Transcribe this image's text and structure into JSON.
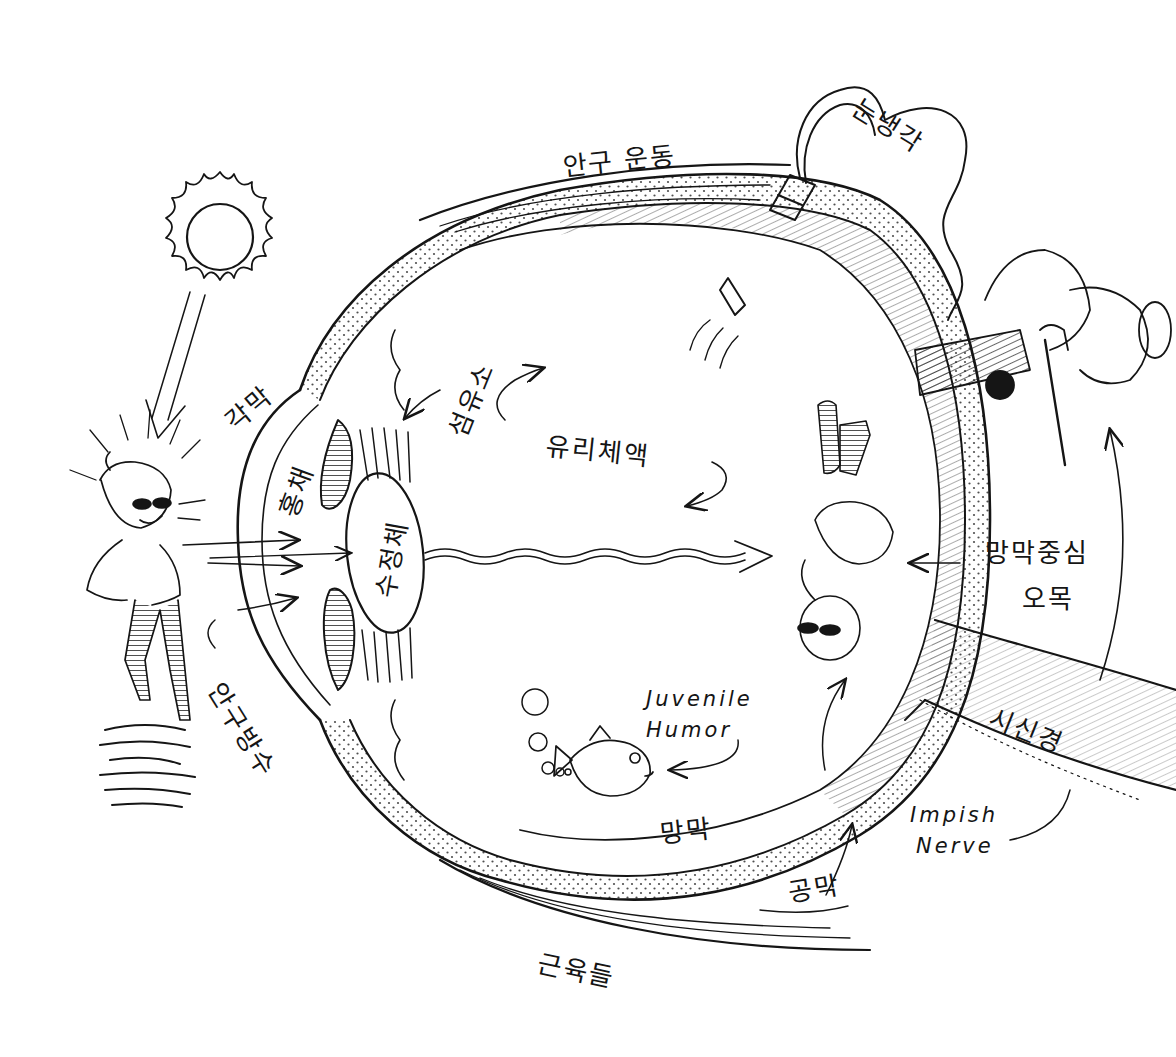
{
  "diagram": {
    "colors": {
      "ink": "#151515",
      "background": "#ffffff"
    },
    "labels": {
      "eye_movement": "안구 운동",
      "cooling_water": "눈냉각",
      "cornea": "각막",
      "iris": "홍채",
      "lens": "수정체",
      "ciliary": "섬유소",
      "vitreous": "유리체액",
      "fovea_line1": "망막중심",
      "fovea_line2": "오목",
      "aqueous": "안구방수",
      "juvenile_line1": "Juvenile",
      "juvenile_line2": "Humor",
      "optic_nerve": "시신경",
      "impish_line1": "Impish",
      "impish_line2": "Nerve",
      "retina": "망막",
      "sclera": "공막",
      "muscles": "근육들"
    },
    "figures": [
      "sun",
      "boy-with-sunglasses",
      "inverted-image-of-boy",
      "fish",
      "bubbles",
      "gnome-with-pump",
      "water-bulb-hose"
    ]
  }
}
